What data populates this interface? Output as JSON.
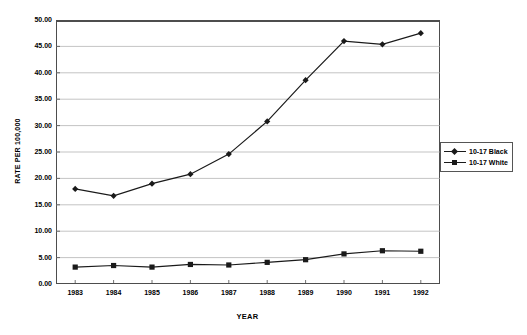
{
  "chart_data": {
    "type": "line",
    "title": "",
    "xlabel": "YEAR",
    "ylabel": "RATE PER 100,000",
    "categories": [
      "1983",
      "1984",
      "1985",
      "1986",
      "1987",
      "1988",
      "1989",
      "1990",
      "1991",
      "1992"
    ],
    "x": [
      1983,
      1984,
      1985,
      1986,
      1987,
      1988,
      1989,
      1990,
      1991,
      1992
    ],
    "series": [
      {
        "name": "10-17 Black",
        "marker": "diamond",
        "color": "#1a1a1a",
        "values": [
          18.0,
          16.7,
          19.0,
          20.8,
          24.6,
          30.8,
          38.6,
          46.0,
          45.4,
          47.5
        ]
      },
      {
        "name": "10-17 White",
        "marker": "square",
        "color": "#1a1a1a",
        "values": [
          3.2,
          3.5,
          3.2,
          3.7,
          3.6,
          4.1,
          4.6,
          5.7,
          6.3,
          6.2
        ]
      }
    ],
    "ylim": [
      0,
      50
    ],
    "yticks": [
      "0.00",
      "5.00",
      "10.00",
      "15.00",
      "20.00",
      "25.00",
      "30.00",
      "35.00",
      "40.00",
      "45.00",
      "50.00"
    ],
    "ytick_values": [
      0,
      5,
      10,
      15,
      20,
      25,
      30,
      35,
      40,
      45,
      50
    ],
    "grid": "horizontal",
    "legend_position": "right",
    "legend": [
      "10-17 Black",
      "10-17 White"
    ],
    "gridline_color": "#aaaaaa",
    "axis_color": "#4d4d4d",
    "line_color": "#1a1a1a",
    "background": "#ffffff"
  }
}
